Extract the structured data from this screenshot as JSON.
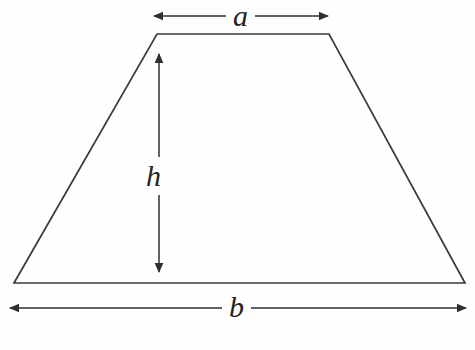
{
  "figure": {
    "kind": "geometry-diagram",
    "shape_name": "trapezoid",
    "background_color": "#fffefe",
    "stroke_color": "#3a3a3a",
    "label_color": "#242424",
    "labels": {
      "top_side": "a",
      "bottom_side": "b",
      "height": "h"
    },
    "shape": {
      "vertices": [
        {
          "name": "top-left",
          "x": 157,
          "y": 34
        },
        {
          "name": "top-right",
          "x": 329,
          "y": 34
        },
        {
          "name": "bottom-right",
          "x": 465,
          "y": 283
        },
        {
          "name": "bottom-left",
          "x": 14,
          "y": 283
        }
      ],
      "top_edge_length_px": 172,
      "bottom_edge_length_px": 451,
      "height_px": 249
    },
    "dimension_lines": [
      {
        "name": "a-dimension",
        "label": "a",
        "orientation": "horizontal",
        "x1": 152,
        "y1": 16,
        "x2": 330,
        "y2": 16,
        "arrowheads": "both"
      },
      {
        "name": "h-dimension",
        "label": "h",
        "orientation": "vertical",
        "x1": 159,
        "y1": 52,
        "x2": 159,
        "y2": 274,
        "arrowheads": "both"
      },
      {
        "name": "b-dimension",
        "label": "b",
        "orientation": "horizontal",
        "x1": 8,
        "y1": 308,
        "x2": 468,
        "y2": 308,
        "arrowheads": "both"
      }
    ]
  }
}
